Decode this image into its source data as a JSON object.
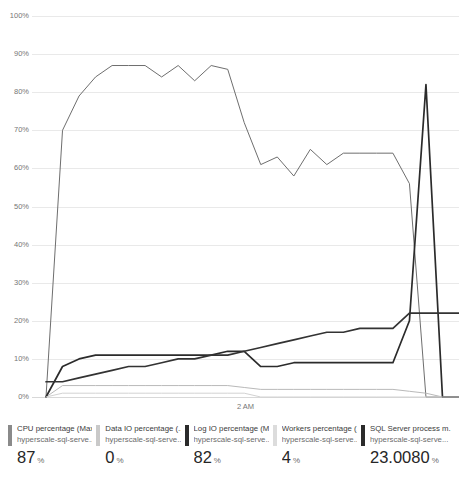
{
  "chart_data": {
    "type": "line",
    "title": "",
    "xlabel": "",
    "ylabel": "",
    "ylim": [
      0,
      100
    ],
    "ytick_labels": [
      "100%",
      "90%",
      "80%",
      "70%",
      "60%",
      "50%",
      "40%",
      "30%",
      "20%",
      "10%",
      "0%"
    ],
    "ytick_values": [
      100,
      90,
      80,
      70,
      60,
      50,
      40,
      30,
      20,
      10,
      0
    ],
    "xtick_labels": [
      "2 AM"
    ],
    "xtick_positions": [
      0.5
    ],
    "grid": true,
    "legend_position": "bottom",
    "series": [
      {
        "name": "CPU percentage (Max)",
        "color": "#6e6e6e",
        "values": [
          0,
          70,
          79,
          84,
          87,
          87,
          87,
          84,
          87,
          83,
          87,
          86,
          72,
          61,
          63,
          58,
          65,
          61,
          64,
          64,
          64,
          64,
          56,
          0,
          0,
          0
        ]
      },
      {
        "name": "Data IO percentage (Avg)",
        "color": "#b9b9b9",
        "values": [
          0,
          3,
          3,
          3,
          3,
          3,
          3,
          3,
          3,
          3,
          3,
          3,
          2.5,
          2,
          2,
          2,
          2,
          2,
          2,
          2,
          2,
          2,
          1.5,
          1,
          0,
          0
        ]
      },
      {
        "name": "Log IO percentage (Max)",
        "color": "#2b2b2b",
        "values": [
          0,
          8,
          10,
          11,
          11,
          11,
          11,
          11,
          11,
          11,
          11,
          12,
          12,
          8,
          8,
          9,
          9,
          9,
          9,
          9,
          9,
          9,
          20,
          82,
          0,
          0
        ]
      },
      {
        "name": "Workers percentage (Avg)",
        "color": "#d2d2d2",
        "values": [
          0,
          1,
          1,
          1,
          1,
          1,
          1,
          1,
          1,
          1,
          1,
          1,
          1,
          0,
          0,
          0,
          0,
          0,
          0,
          0,
          0,
          0,
          0,
          0,
          0,
          0
        ]
      },
      {
        "name": "SQL Server process memory percentage",
        "color": "#333333",
        "values": [
          4,
          4,
          5,
          6,
          7,
          8,
          8,
          9,
          10,
          10,
          11,
          11,
          12,
          13,
          14,
          15,
          16,
          17,
          17,
          18,
          18,
          18,
          22,
          22,
          22,
          22
        ]
      }
    ]
  },
  "legend": {
    "items": [
      {
        "title": "CPU percentage (Max)",
        "subtitle": "hyperscale-sql-serve...",
        "value": "87",
        "unit": "%",
        "color": "#8a8a8a"
      },
      {
        "title": "Data IO percentage (...",
        "subtitle": "hyperscale-sql-serve...",
        "value": "0",
        "unit": "%",
        "color": "#c9c9c9"
      },
      {
        "title": "Log IO percentage (Max)",
        "subtitle": "hyperscale-sql-serve...",
        "value": "82",
        "unit": "%",
        "color": "#2b2b2b"
      },
      {
        "title": "Workers percentage (...",
        "subtitle": "hyperscale-sql-serve...",
        "value": "4",
        "unit": "%",
        "color": "#dcdcdc"
      },
      {
        "title": "SQL Server process m...",
        "subtitle": "hyperscale-sql-serve...",
        "value": "23.0080",
        "unit": "%",
        "color": "#2b2b2b"
      }
    ]
  }
}
